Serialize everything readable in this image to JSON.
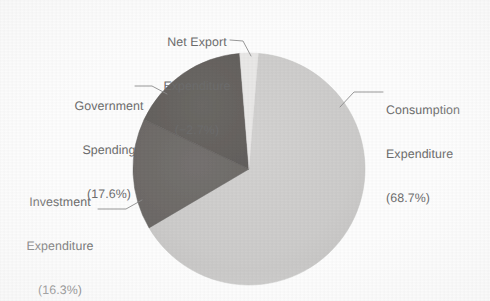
{
  "chart_data": {
    "type": "pie",
    "title": "",
    "subtitle": "",
    "xlabel": "",
    "ylabel": "",
    "legend_position": "none",
    "grid": false,
    "labels_with_leader_lines": true,
    "categories": [
      "Consumption Expenditure",
      "Investment Expenditure",
      "Government Spending",
      "Net Export Expenditure"
    ],
    "values": [
      68.7,
      16.3,
      17.6,
      -2.7
    ],
    "value_unit": "%",
    "slices": [
      {
        "name": "Consumption Expenditure",
        "value": 68.7,
        "value_text": "(68.7%)",
        "color": "#cdcccb",
        "label_lines": [
          "Consumption",
          "Expenditure",
          "(68.7%)"
        ]
      },
      {
        "name": "Investment Expenditure",
        "value": 16.3,
        "value_text": "(16.3%)",
        "color": "#716e6b",
        "label_lines": [
          "Investment",
          "Expenditure",
          "(16.3%)"
        ]
      },
      {
        "name": "Government Spending",
        "value": 17.6,
        "value_text": "(17.6%)",
        "color": "#676461",
        "label_lines": [
          "Government",
          "Spending",
          "(17.6%)"
        ]
      },
      {
        "name": "Net Export Expenditure",
        "value": -2.7,
        "value_text": "(−2.7%)",
        "color": "#e9e8e7",
        "label_lines": [
          "Net Export",
          "Expenditure",
          "(−2.7%)"
        ]
      }
    ]
  },
  "labels": {
    "net_export": {
      "line1": "Net Export",
      "line2": "Expenditure",
      "line3": "(−2.7%)"
    },
    "government": {
      "line1": "Government",
      "line2": "Spending",
      "line3": "(17.6%)"
    },
    "investment": {
      "line1": "Investment",
      "line2": "Expenditure",
      "line3": "(16.3%)"
    },
    "consumption": {
      "line1": "Consumption",
      "line2": "Expenditure",
      "line3": "(68.7%)"
    }
  },
  "style": {
    "background": "#fdfdfd",
    "text_color": "#6d6d6d",
    "leader_line_color": "#8d8d8d",
    "slice_consumption": "#cdcccb",
    "slice_investment": "#716e6b",
    "slice_government": "#676461",
    "slice_net_export": "#e9e8e7"
  }
}
